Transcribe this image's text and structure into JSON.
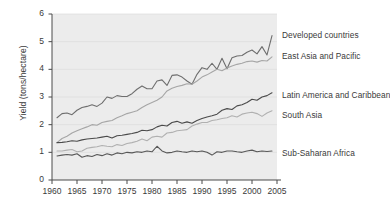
{
  "chart_data": {
    "type": "line",
    "title": "",
    "xlabel": "",
    "ylabel": "Yield (tons/hectare)",
    "xlim": [
      1960,
      2005
    ],
    "ylim": [
      0,
      6
    ],
    "grid": true,
    "legend_position": "right-inline",
    "xticks": [
      "1960",
      "1965",
      "1970",
      "1975",
      "1980",
      "1985",
      "1990",
      "1995",
      "2000",
      "2005"
    ],
    "yticks": [
      "0",
      "1",
      "2",
      "3",
      "4",
      "5",
      "6"
    ],
    "x": [
      1961,
      1962,
      1963,
      1964,
      1965,
      1966,
      1967,
      1968,
      1969,
      1970,
      1971,
      1972,
      1973,
      1974,
      1975,
      1976,
      1977,
      1978,
      1979,
      1980,
      1981,
      1982,
      1983,
      1984,
      1985,
      1986,
      1987,
      1988,
      1989,
      1990,
      1991,
      1992,
      1993,
      1994,
      1995,
      1996,
      1997,
      1998,
      1999,
      2000,
      2001,
      2002,
      2003,
      2004
    ],
    "series": [
      {
        "name": "Developed countries",
        "color": "#6e6e6e",
        "values": [
          2.25,
          2.4,
          2.42,
          2.36,
          2.52,
          2.62,
          2.66,
          2.72,
          2.66,
          2.78,
          3.0,
          2.95,
          3.05,
          3.02,
          3.02,
          3.12,
          3.28,
          3.4,
          3.3,
          3.3,
          3.58,
          3.62,
          3.42,
          3.78,
          3.8,
          3.72,
          3.58,
          3.46,
          3.82,
          4.06,
          4.0,
          4.22,
          4.0,
          4.4,
          4.02,
          4.42,
          4.48,
          4.5,
          4.62,
          4.7,
          4.56,
          4.82,
          4.52,
          5.22
        ]
      },
      {
        "name": "East Asia and Pacific",
        "color": "#a6a6a6",
        "values": [
          1.35,
          1.5,
          1.58,
          1.7,
          1.78,
          1.85,
          1.92,
          2.0,
          1.98,
          2.08,
          2.12,
          2.15,
          2.25,
          2.32,
          2.4,
          2.45,
          2.5,
          2.62,
          2.72,
          2.8,
          2.88,
          3.0,
          3.22,
          3.32,
          3.38,
          3.42,
          3.48,
          3.46,
          3.58,
          3.72,
          3.8,
          3.9,
          4.0,
          3.95,
          4.05,
          4.12,
          4.18,
          4.22,
          4.28,
          4.3,
          4.26,
          4.32,
          4.3,
          4.45
        ]
      },
      {
        "name": "Latin America and Caribbean",
        "color": "#4a4a4a",
        "values": [
          1.35,
          1.36,
          1.38,
          1.42,
          1.4,
          1.45,
          1.48,
          1.5,
          1.52,
          1.55,
          1.58,
          1.52,
          1.6,
          1.62,
          1.65,
          1.68,
          1.72,
          1.8,
          1.78,
          1.82,
          1.92,
          1.98,
          1.95,
          2.08,
          2.12,
          2.05,
          2.1,
          2.05,
          2.15,
          2.22,
          2.28,
          2.32,
          2.38,
          2.52,
          2.58,
          2.55,
          2.68,
          2.72,
          2.8,
          2.92,
          2.88,
          3.0,
          3.05,
          3.15
        ]
      },
      {
        "name": "South Asia",
        "color": "#b0b0b0",
        "values": [
          1.05,
          1.05,
          1.08,
          1.1,
          1.02,
          1.05,
          1.15,
          1.18,
          1.2,
          1.25,
          1.22,
          1.2,
          1.28,
          1.25,
          1.32,
          1.35,
          1.4,
          1.48,
          1.42,
          1.55,
          1.58,
          1.55,
          1.7,
          1.72,
          1.78,
          1.8,
          1.82,
          1.95,
          2.02,
          2.08,
          2.08,
          2.15,
          2.18,
          2.22,
          2.25,
          2.32,
          2.28,
          2.38,
          2.42,
          2.45,
          2.4,
          2.3,
          2.42,
          2.5
        ]
      },
      {
        "name": "Sub-Saharan Africa",
        "color": "#585858",
        "values": [
          0.87,
          0.9,
          0.92,
          0.9,
          0.95,
          0.82,
          0.88,
          0.85,
          0.92,
          0.88,
          0.95,
          0.9,
          0.98,
          0.95,
          1.0,
          0.98,
          1.02,
          1.0,
          1.05,
          1.02,
          1.22,
          1.05,
          0.98,
          1.0,
          1.05,
          1.02,
          1.0,
          1.05,
          1.02,
          1.05,
          1.0,
          0.9,
          1.02,
          1.0,
          1.05,
          1.05,
          1.02,
          1.0,
          1.05,
          1.08,
          1.02,
          1.05,
          1.03,
          1.05
        ]
      }
    ],
    "annotations": [
      {
        "name": "Developed countries",
        "x_px": 282,
        "y_px": 30
      },
      {
        "name": "East Asia and Pacific",
        "x_px": 282,
        "y_px": 51
      },
      {
        "name": "Latin America and Caribbean",
        "x_px": 282,
        "y_px": 90
      },
      {
        "name": "South Asia",
        "x_px": 282,
        "y_px": 110
      },
      {
        "name": "Sub-Saharan Africa",
        "x_px": 282,
        "y_px": 148
      }
    ]
  }
}
